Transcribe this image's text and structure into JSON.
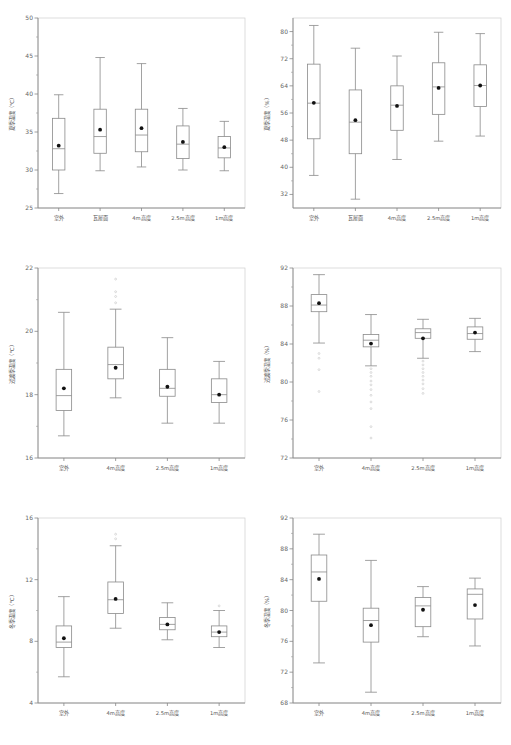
{
  "figure": {
    "title": "",
    "panel_count": 6,
    "layout": "2 columns x 3 rows"
  },
  "chart_data": [
    {
      "id": "summer-temperature",
      "type": "box",
      "title": "",
      "xlabel": "",
      "ylabel": "夏季温度（℃）",
      "ylim": [
        25,
        50
      ],
      "yticks": [
        25,
        30,
        35,
        40,
        45,
        50
      ],
      "ytick_labels": [
        "25",
        "30",
        "35",
        "40",
        "45",
        "50"
      ],
      "grid": false,
      "legend": "none",
      "categories": [
        "室外",
        "瓦屋面",
        "4m高度",
        "2.5m高度",
        "1m高度"
      ],
      "boxes": [
        {
          "category": "室外",
          "min": 26.9,
          "q1": 30.0,
          "median": 32.8,
          "q3": 36.8,
          "max": 39.9,
          "mean": 33.2,
          "outliers": []
        },
        {
          "category": "瓦屋面",
          "min": 29.9,
          "q1": 32.2,
          "median": 34.4,
          "q3": 38.0,
          "max": 44.8,
          "mean": 35.3,
          "outliers": []
        },
        {
          "category": "4m高度",
          "min": 30.4,
          "q1": 32.4,
          "median": 34.6,
          "q3": 38.0,
          "max": 44.0,
          "mean": 35.5,
          "outliers": []
        },
        {
          "category": "2.5m高度",
          "min": 30.0,
          "q1": 31.5,
          "median": 33.4,
          "q3": 35.8,
          "max": 38.1,
          "mean": 33.7,
          "outliers": []
        },
        {
          "category": "1m高度",
          "min": 29.9,
          "q1": 31.6,
          "median": 32.9,
          "q3": 34.4,
          "max": 36.4,
          "mean": 33.0,
          "outliers": []
        }
      ]
    },
    {
      "id": "summer-humidity",
      "type": "box",
      "title": "",
      "xlabel": "",
      "ylabel": "夏季湿度（%）",
      "ylim": [
        28,
        84
      ],
      "yticks": [
        32,
        40,
        48,
        56,
        64,
        72,
        80
      ],
      "ytick_labels": [
        "32",
        "40",
        "48",
        "56",
        "64",
        "72",
        "80"
      ],
      "grid": false,
      "legend": "none",
      "categories": [
        "室外",
        "瓦屋面",
        "4m高度",
        "2.5m高度",
        "1m高度"
      ],
      "boxes": [
        {
          "category": "室外",
          "min": 37.6,
          "q1": 48.4,
          "median": 58.9,
          "q3": 70.4,
          "max": 81.8,
          "mean": 59.0,
          "outliers": []
        },
        {
          "category": "瓦屋面",
          "min": 30.6,
          "q1": 44.0,
          "median": 53.3,
          "q3": 62.8,
          "max": 75.1,
          "mean": 53.9,
          "outliers": []
        },
        {
          "category": "4m高度",
          "min": 42.3,
          "q1": 50.9,
          "median": 58.3,
          "q3": 64.0,
          "max": 72.8,
          "mean": 58.1,
          "outliers": []
        },
        {
          "category": "2.5m高度",
          "min": 47.7,
          "q1": 55.6,
          "median": 63.7,
          "q3": 70.8,
          "max": 79.8,
          "mean": 63.4,
          "outliers": []
        },
        {
          "category": "1m高度",
          "min": 49.2,
          "q1": 57.9,
          "median": 64.1,
          "q3": 70.2,
          "max": 79.4,
          "mean": 64.1,
          "outliers": []
        }
      ]
    },
    {
      "id": "transition-season-temperature",
      "type": "box",
      "title": "",
      "xlabel": "",
      "ylabel": "过渡季温度（℃）",
      "ylim": [
        16,
        22
      ],
      "yticks": [
        16,
        18,
        20,
        22
      ],
      "ytick_labels": [
        "16",
        "18",
        "20",
        "22"
      ],
      "grid": false,
      "legend": "none",
      "categories": [
        "室外",
        "4m高度",
        "2.5m高度",
        "1m高度"
      ],
      "boxes": [
        {
          "category": "室外",
          "min": 16.7,
          "q1": 17.5,
          "median": 17.97,
          "q3": 18.8,
          "max": 20.6,
          "mean": 18.2,
          "outliers": []
        },
        {
          "category": "4m高度",
          "min": 17.9,
          "q1": 18.5,
          "median": 18.95,
          "q3": 19.5,
          "max": 20.7,
          "mean": 18.85,
          "outliers": [
            20.9,
            21.1,
            21.25,
            21.65
          ]
        },
        {
          "category": "2.5m高度",
          "min": 17.1,
          "q1": 17.95,
          "median": 18.2,
          "q3": 18.8,
          "max": 19.8,
          "mean": 18.25,
          "outliers": []
        },
        {
          "category": "1m高度",
          "min": 17.1,
          "q1": 17.75,
          "median": 18.0,
          "q3": 18.5,
          "max": 19.05,
          "mean": 18.0,
          "outliers": []
        }
      ]
    },
    {
      "id": "transition-season-humidity",
      "type": "box",
      "title": "",
      "xlabel": "",
      "ylabel": "过渡季湿度（%）",
      "ylim": [
        72,
        92
      ],
      "yticks": [
        72,
        76,
        80,
        84,
        88,
        92
      ],
      "ytick_labels": [
        "72",
        "76",
        "80",
        "84",
        "88",
        "92"
      ],
      "grid": false,
      "legend": "none",
      "categories": [
        "室外",
        "4m高度",
        "2.5m高度",
        "1m高度"
      ],
      "boxes": [
        {
          "category": "室外",
          "min": 84.1,
          "q1": 87.4,
          "median": 88.1,
          "q3": 89.2,
          "max": 91.3,
          "mean": 88.3,
          "outliers": [
            83.0,
            82.5,
            81.3,
            79.0
          ]
        },
        {
          "category": "4m高度",
          "min": 81.7,
          "q1": 83.7,
          "median": 84.4,
          "q3": 85.0,
          "max": 87.1,
          "mean": 84.05,
          "outliers": [
            81.4,
            81.0,
            80.6,
            80.1,
            79.7,
            79.2,
            78.6,
            77.9,
            77.2,
            75.3,
            74.1
          ]
        },
        {
          "category": "2.5m高度",
          "min": 82.5,
          "q1": 84.6,
          "median": 85.2,
          "q3": 85.6,
          "max": 86.6,
          "mean": 84.6,
          "outliers": [
            82.2,
            81.8,
            81.4,
            81.0,
            80.6,
            80.2,
            79.8,
            79.3,
            78.8
          ]
        },
        {
          "category": "1m高度",
          "min": 83.2,
          "q1": 84.5,
          "median": 85.1,
          "q3": 85.8,
          "max": 86.7,
          "mean": 85.2,
          "outliers": []
        }
      ]
    },
    {
      "id": "winter-temperature",
      "type": "box",
      "title": "",
      "xlabel": "",
      "ylabel": "冬季温度（℃）",
      "ylim": [
        4,
        16
      ],
      "yticks": [
        4,
        8,
        12,
        16
      ],
      "ytick_labels": [
        "4",
        "8",
        "12",
        "16"
      ],
      "grid": false,
      "legend": "none",
      "categories": [
        "室外",
        "4m高度",
        "2.5m高度",
        "1m高度"
      ],
      "boxes": [
        {
          "category": "室外",
          "min": 5.7,
          "q1": 7.6,
          "median": 7.95,
          "q3": 9.0,
          "max": 10.9,
          "mean": 8.2,
          "outliers": []
        },
        {
          "category": "4m高度",
          "min": 8.85,
          "q1": 9.8,
          "median": 10.7,
          "q3": 11.85,
          "max": 14.2,
          "mean": 10.75,
          "outliers": [
            14.65,
            14.95
          ]
        },
        {
          "category": "2.5m高度",
          "min": 8.1,
          "q1": 8.75,
          "median": 9.1,
          "q3": 9.55,
          "max": 10.5,
          "mean": 9.1,
          "outliers": []
        },
        {
          "category": "1m高度",
          "min": 7.6,
          "q1": 8.3,
          "median": 8.6,
          "q3": 9.0,
          "max": 10.0,
          "mean": 8.6,
          "outliers": [
            10.3
          ]
        }
      ]
    },
    {
      "id": "winter-humidity",
      "type": "box",
      "title": "",
      "xlabel": "",
      "ylabel": "冬季湿度（%）",
      "ylim": [
        68,
        92
      ],
      "yticks": [
        68,
        72,
        76,
        80,
        84,
        88,
        92
      ],
      "ytick_labels": [
        "68",
        "72",
        "76",
        "80",
        "84",
        "88",
        "92"
      ],
      "grid": false,
      "legend": "none",
      "categories": [
        "室外",
        "4m高度",
        "2.5m高度",
        "1m高度"
      ],
      "boxes": [
        {
          "category": "室外",
          "min": 73.2,
          "q1": 81.2,
          "median": 85.0,
          "q3": 87.2,
          "max": 89.9,
          "mean": 84.1,
          "outliers": []
        },
        {
          "category": "4m高度",
          "min": 69.4,
          "q1": 75.9,
          "median": 78.7,
          "q3": 80.3,
          "max": 86.5,
          "mean": 78.1,
          "outliers": []
        },
        {
          "category": "2.5m高度",
          "min": 76.6,
          "q1": 77.9,
          "median": 80.6,
          "q3": 81.7,
          "max": 83.1,
          "mean": 80.1,
          "outliers": []
        },
        {
          "category": "1m高度",
          "min": 75.4,
          "q1": 78.9,
          "median": 82.1,
          "q3": 82.8,
          "max": 84.2,
          "mean": 80.7,
          "outliers": []
        }
      ]
    }
  ]
}
